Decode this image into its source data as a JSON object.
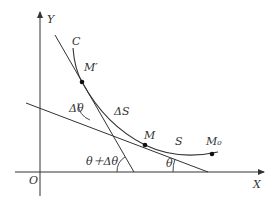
{
  "diagram": {
    "type": "curve-tangent-angle-diagram",
    "colors": {
      "line": "#333333",
      "background": "#ffffff",
      "point": "#111111"
    },
    "axes": {
      "origin_label": "O",
      "x_label": "X",
      "y_label": "Y"
    },
    "curve": {
      "label": "C"
    },
    "points": [
      {
        "id": "M_prime",
        "label": "M′"
      },
      {
        "id": "M",
        "label": "M"
      },
      {
        "id": "M0",
        "label": "M₀"
      }
    ],
    "arc_labels": {
      "delta_s": "ΔS",
      "s": "S"
    },
    "angles": {
      "delta_theta": "Δθ",
      "theta_plus_delta": "θ＋Δθ",
      "theta": "θ"
    }
  }
}
